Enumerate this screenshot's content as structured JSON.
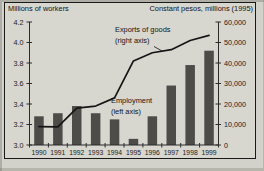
{
  "colors": {
    "bar": "#4e4c49",
    "line": "#161616",
    "axis": "#2b2b2b",
    "text": "#1c1c1c",
    "background": "#d7d6cf",
    "border": "#1a1a1a"
  },
  "annotations": {
    "exports_line1": "Exports of goods",
    "exports_line2": "(right axis)",
    "employment_line1": "Employment",
    "employment_line2": "(left axis)"
  },
  "chart_data": {
    "type": "bar",
    "title_left_axis": "Millions of workers",
    "title_right_axis": "Constant pesos, millions (1995)",
    "categories": [
      "1990",
      "1991",
      "1992",
      "1993",
      "1994",
      "1995",
      "1996",
      "1997",
      "1998",
      "1999"
    ],
    "series": [
      {
        "name": "Employment (left axis)",
        "type": "bar",
        "axis": "left",
        "values": [
          3.28,
          3.31,
          3.38,
          3.31,
          3.25,
          3.06,
          3.28,
          3.58,
          3.78,
          3.92
        ]
      },
      {
        "name": "Exports of goods (right axis)",
        "type": "line",
        "axis": "right",
        "values": [
          9000,
          8800,
          18000,
          19000,
          23000,
          41000,
          45000,
          46500,
          51000,
          53500
        ]
      }
    ],
    "left_axis": {
      "min": 3.0,
      "max": 4.2,
      "tick_values": [
        4.2,
        4.0,
        3.8,
        3.6,
        3.4,
        3.2,
        3.0
      ],
      "tick_labels": [
        "4.2",
        "4.0",
        "3.8",
        "3.6",
        "3.4",
        "3.2",
        "3.0"
      ]
    },
    "right_axis": {
      "min": 0,
      "max": 60000,
      "tick_values": [
        60000,
        50000,
        40000,
        30000,
        20000,
        10000,
        0
      ],
      "tick_labels": [
        "60,000",
        "50,000",
        "40,000",
        "30,000",
        "20,000",
        "10,000",
        "0"
      ]
    },
    "grid": "off",
    "legend": "inline-annotations"
  }
}
